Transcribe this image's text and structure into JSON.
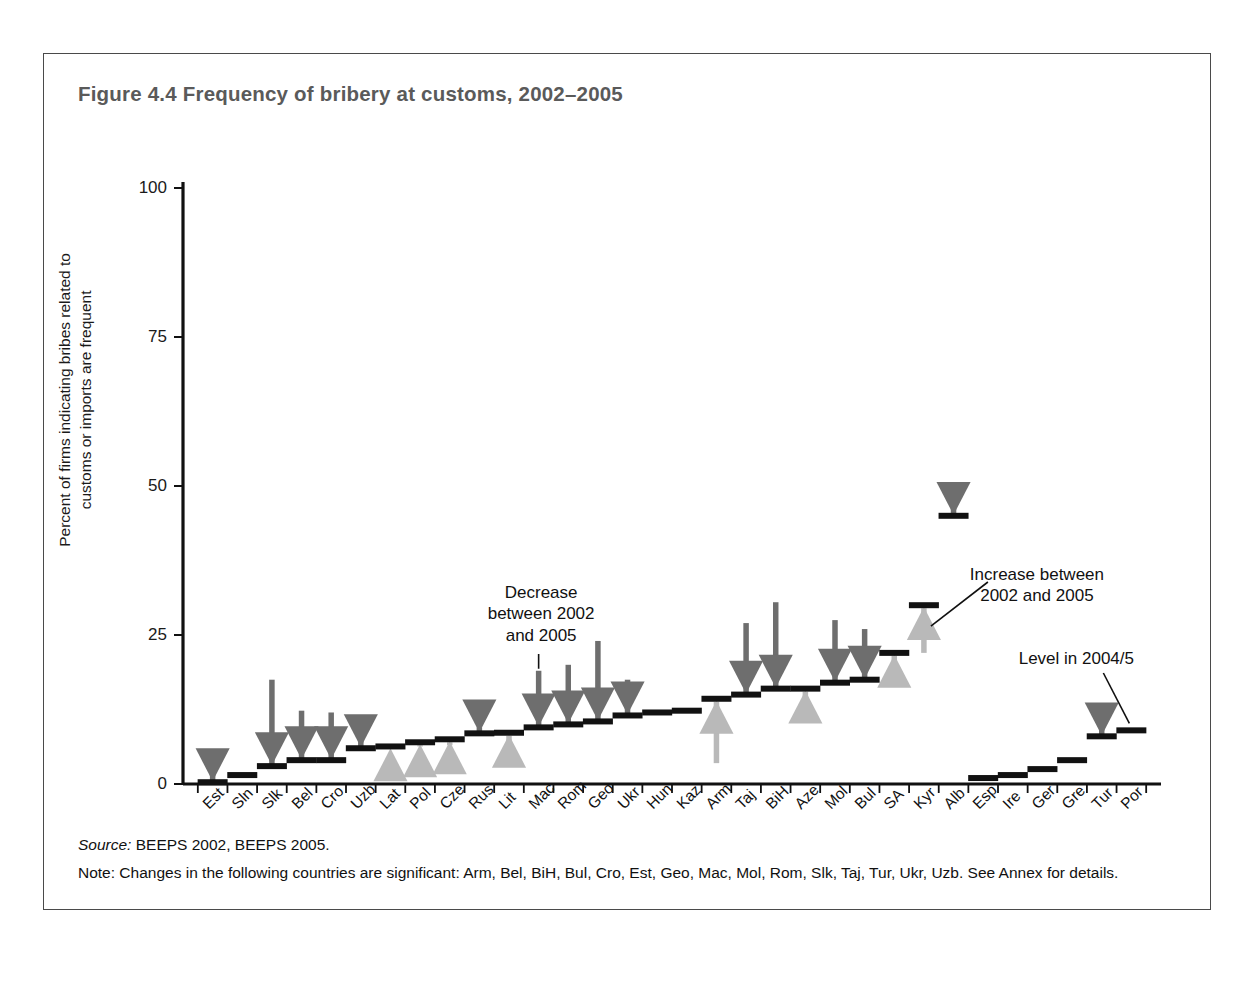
{
  "figure": {
    "title": "Figure 4.4  Frequency of bribery at customs, 2002–2005",
    "source_label": "Source:",
    "source_text": " BEEPS 2002, BEEPS 2005.",
    "note_text": "Note: Changes in the following countries are significant: Arm, Bel, BiH, Bul, Cro, Est, Geo, Mac, Mol, Rom, Slk, Taj, Tur, Ukr, Uzb. See Annex for details."
  },
  "annotations": {
    "decrease": "Decrease\nbetween 2002\nand 2005",
    "increase": "Increase between\n2002 and 2005",
    "level": "Level in 2004/5"
  },
  "colors": {
    "frame": "#4a4a4a",
    "title": "#5a5a5a",
    "decrease_arrow": "#6e6e6e",
    "increase_arrow": "#b9b9b9",
    "level_bar": "#111111",
    "axis": "#111111"
  },
  "chart_data": {
    "type": "bar",
    "title": "Frequency of bribery at customs, 2002–2005",
    "xlabel": "",
    "ylabel": "Percent of firms indicating bribes related to\ncustoms or imports are frequent",
    "ylim": [
      0,
      100
    ],
    "yticks": [
      0,
      25,
      50,
      75,
      100
    ],
    "ytick_labels": [
      "0",
      "25",
      "50",
      "75",
      "100"
    ],
    "grid": false,
    "legend": "none",
    "categories": [
      "Est",
      "Sln",
      "Slk",
      "Bel",
      "Cro",
      "Uzb",
      "Lat",
      "Pol",
      "Cze",
      "Rus",
      "Lit",
      "Mac",
      "Rom",
      "Geo",
      "Ukr",
      "Hun",
      "Kaz",
      "Arm",
      "Taj",
      "BiH",
      "Aze",
      "Mol",
      "Bul",
      "SA",
      "Kyr",
      "Alb",
      "Esp",
      "Ire",
      "Ger",
      "Gre",
      "Tur",
      "Por"
    ],
    "series": [
      {
        "name": "Level in 2004/5",
        "values": [
          0.3,
          1.5,
          3.0,
          4.0,
          4.0,
          6.0,
          6.3,
          7.0,
          7.5,
          8.5,
          8.6,
          9.5,
          10.0,
          10.5,
          11.5,
          12.0,
          12.3,
          14.3,
          15.0,
          16.0,
          16.0,
          17.0,
          17.5,
          22.0,
          30.0,
          45.0,
          1.0,
          1.5,
          2.5,
          4.0,
          8.0,
          9.0
        ]
      },
      {
        "name": "Level in 2002",
        "values": [
          2.5,
          1.5,
          17.5,
          12.3,
          12.0,
          10.0,
          5.8,
          6.3,
          6.5,
          9.5,
          7.0,
          19.0,
          20.0,
          24.0,
          17.5,
          12.0,
          12.3,
          3.5,
          27.0,
          30.5,
          13.0,
          27.5,
          26.0,
          19.5,
          22.0,
          47.0,
          1.0,
          1.5,
          2.5,
          4.0,
          12.0,
          9.0
        ]
      }
    ],
    "changes": [
      {
        "country": "Est",
        "direction": "decrease",
        "from": 2.5,
        "to": 0.3
      },
      {
        "country": "Sln",
        "direction": "none",
        "from": 1.5,
        "to": 1.5
      },
      {
        "country": "Slk",
        "direction": "decrease",
        "from": 17.5,
        "to": 3.0
      },
      {
        "country": "Bel",
        "direction": "decrease",
        "from": 12.3,
        "to": 4.0
      },
      {
        "country": "Cro",
        "direction": "decrease",
        "from": 12.0,
        "to": 4.0
      },
      {
        "country": "Uzb",
        "direction": "decrease",
        "from": 10.0,
        "to": 6.0
      },
      {
        "country": "Lat",
        "direction": "increase",
        "from": 5.8,
        "to": 6.3
      },
      {
        "country": "Pol",
        "direction": "increase",
        "from": 6.3,
        "to": 7.0
      },
      {
        "country": "Cze",
        "direction": "increase",
        "from": 6.5,
        "to": 7.5
      },
      {
        "country": "Rus",
        "direction": "decrease",
        "from": 9.5,
        "to": 8.5
      },
      {
        "country": "Lit",
        "direction": "increase",
        "from": 7.0,
        "to": 8.6
      },
      {
        "country": "Mac",
        "direction": "decrease",
        "from": 19.0,
        "to": 9.5
      },
      {
        "country": "Rom",
        "direction": "decrease",
        "from": 20.0,
        "to": 10.0
      },
      {
        "country": "Geo",
        "direction": "decrease",
        "from": 24.0,
        "to": 10.5
      },
      {
        "country": "Ukr",
        "direction": "decrease",
        "from": 17.5,
        "to": 11.5
      },
      {
        "country": "Hun",
        "direction": "none",
        "from": 12.0,
        "to": 12.0
      },
      {
        "country": "Kaz",
        "direction": "none",
        "from": 12.3,
        "to": 12.3
      },
      {
        "country": "Arm",
        "direction": "increase",
        "from": 3.5,
        "to": 14.3
      },
      {
        "country": "Taj",
        "direction": "decrease",
        "from": 27.0,
        "to": 15.0
      },
      {
        "country": "BiH",
        "direction": "decrease",
        "from": 30.5,
        "to": 16.0
      },
      {
        "country": "Aze",
        "direction": "increase",
        "from": 13.0,
        "to": 16.0
      },
      {
        "country": "Mol",
        "direction": "decrease",
        "from": 27.5,
        "to": 17.0
      },
      {
        "country": "Bul",
        "direction": "decrease",
        "from": 26.0,
        "to": 17.5
      },
      {
        "country": "SA",
        "direction": "increase",
        "from": 19.5,
        "to": 22.0
      },
      {
        "country": "Kyr",
        "direction": "increase",
        "from": 22.0,
        "to": 30.0
      },
      {
        "country": "Alb",
        "direction": "decrease",
        "from": 47.0,
        "to": 45.0
      },
      {
        "country": "Esp",
        "direction": "none",
        "from": 1.0,
        "to": 1.0
      },
      {
        "country": "Ire",
        "direction": "none",
        "from": 1.5,
        "to": 1.5
      },
      {
        "country": "Ger",
        "direction": "none",
        "from": 2.5,
        "to": 2.5
      },
      {
        "country": "Gre",
        "direction": "none",
        "from": 4.0,
        "to": 4.0
      },
      {
        "country": "Tur",
        "direction": "decrease",
        "from": 12.0,
        "to": 8.0
      },
      {
        "country": "Por",
        "direction": "none",
        "from": 9.0,
        "to": 9.0
      }
    ]
  }
}
